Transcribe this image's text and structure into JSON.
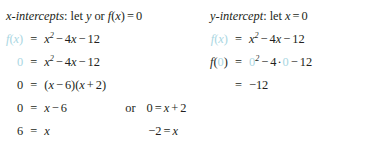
{
  "document": {
    "type": "math-worksheet",
    "topic": "Intercepts of a quadratic function",
    "function": "f(x) = x^2 - 4x - 12",
    "accent_color": "#a9d6e2",
    "text_color": "#231f20",
    "background_color": "#ffffff"
  },
  "left_column": {
    "heading": {
      "label": "x-intercepts",
      "colon": ":",
      "instruction_word": "let",
      "var_y": "y",
      "conjunction": "or",
      "fx": "f",
      "fx_paren_open": "(",
      "fx_arg": "x",
      "fx_paren_close": ")",
      "equals": "=",
      "value": "0",
      "full_text": "x-intercepts: let y or f(x) = 0"
    },
    "lines": [
      {
        "id": "line-1",
        "lhs": "f(x)",
        "equals": "=",
        "rhs": "x² − 4x − 12",
        "lhs_highlighted": true,
        "full_text": "f(x) = x² − 4x − 12"
      },
      {
        "id": "line-2",
        "lhs": "0",
        "equals": "=",
        "rhs": "x² − 4x − 12",
        "lhs_highlighted": true,
        "full_text": "0 = x² − 4x − 12"
      },
      {
        "id": "line-3",
        "lhs": "0",
        "equals": "=",
        "rhs": "(x − 6)(x + 2)",
        "lhs_highlighted": false,
        "full_text": "0 = (x − 6)(x + 2)"
      },
      {
        "id": "line-4",
        "lhs": "0",
        "equals": "=",
        "rhs": "x − 6",
        "connector": "or",
        "tail": "0 = x + 2",
        "lhs_highlighted": false,
        "full_text": "0 = x − 6   or   0 = x + 2"
      },
      {
        "id": "line-5",
        "lhs": "6",
        "equals": "=",
        "rhs": "x",
        "tail": "−2 = x",
        "lhs_highlighted": false,
        "full_text": "6 = x          −2 = x"
      }
    ],
    "solutions": [
      "6",
      "-2"
    ]
  },
  "right_column": {
    "heading": {
      "label": "y-intercept",
      "colon": ":",
      "instruction_word": "let",
      "var_x": "x",
      "equals": "=",
      "value": "0",
      "full_text": "y-intercept: let x = 0"
    },
    "lines": [
      {
        "id": "rline-1",
        "lhs": "f(x)",
        "equals": "=",
        "rhs": "x² − 4x − 12",
        "lhs_highlighted": true,
        "full_text": "f(x) = x² − 4x − 12"
      },
      {
        "id": "rline-2",
        "lhs": "f(0)",
        "equals": "=",
        "rhs": "0² − 4·0 − 12",
        "substituted_value": "0",
        "full_text": "f(0) = 0² − 4·0 − 12"
      },
      {
        "id": "rline-3",
        "lhs": "",
        "equals": "=",
        "rhs": "−12",
        "full_text": "= −12"
      }
    ],
    "solutions": [
      "-12"
    ]
  },
  "tokens": {
    "f": "f",
    "x": "x",
    "y": "y",
    "paren_open": "(",
    "paren_close": ")",
    "equals": "=",
    "minus": "−",
    "plus": "+",
    "dot": "·",
    "exp2": "2",
    "zero": "0",
    "four": "4",
    "six": "6",
    "two": "2",
    "twelve": "12",
    "neg_two": "−2",
    "neg_twelve": "−12",
    "colon": ":",
    "word_let": "let",
    "word_or": "or",
    "label_x_intercepts": "x-intercepts",
    "label_y_intercept": "y-intercept"
  }
}
